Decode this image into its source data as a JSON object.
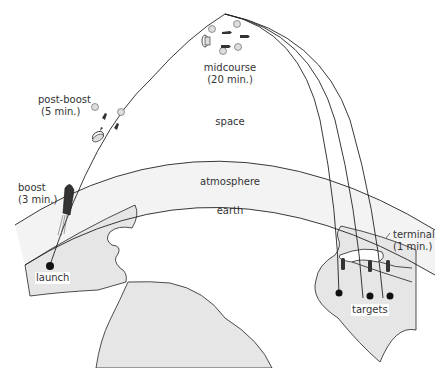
{
  "diagram": {
    "type": "ICBM flight trajectory",
    "regions": {
      "space": "space",
      "atmosphere": "atmosphere",
      "earth": "earth"
    },
    "phases": [
      {
        "id": "boost",
        "name": "boost",
        "duration": "(3 min.)"
      },
      {
        "id": "post-boost",
        "name": "post-boost",
        "duration": "(5 min.)"
      },
      {
        "id": "midcourse",
        "name": "midcourse",
        "duration": "(20 min.)"
      },
      {
        "id": "terminal",
        "name": "terminal",
        "duration": "(1 min.)"
      }
    ],
    "points": {
      "launch": "launch",
      "targets": "targets"
    },
    "colors": {
      "land": "#e6e6e6",
      "atmosphere": "#f4f4f4",
      "line": "#222222",
      "decoy": "#d9d9d9",
      "warhead": "#333333"
    }
  }
}
